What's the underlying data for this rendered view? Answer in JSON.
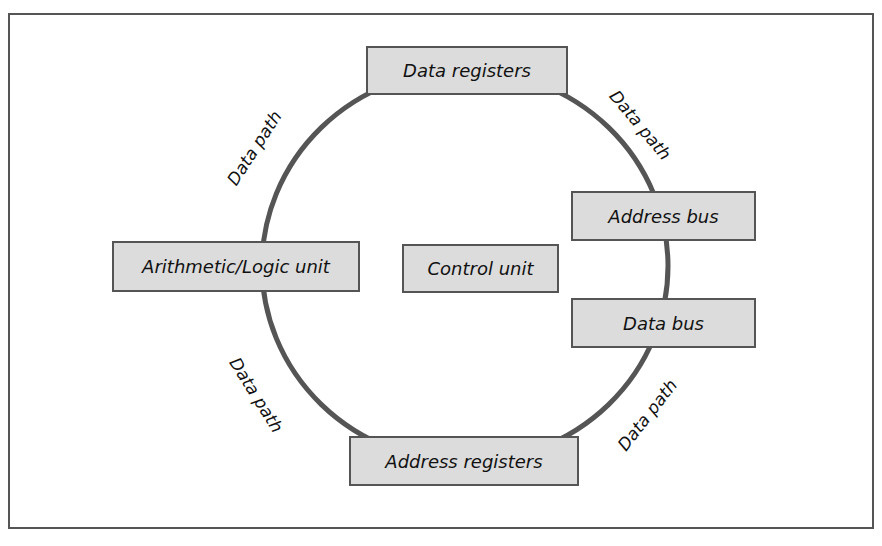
{
  "diagram": {
    "title": "",
    "nodes": [
      {
        "id": "data-registers",
        "label": "Data registers"
      },
      {
        "id": "alu",
        "label": "Arithmetic/Logic unit"
      },
      {
        "id": "control-unit",
        "label": "Control unit"
      },
      {
        "id": "address-bus",
        "label": "Address bus"
      },
      {
        "id": "data-bus",
        "label": "Data bus"
      },
      {
        "id": "address-registers",
        "label": "Address registers"
      }
    ],
    "edge_labels": [
      {
        "id": "top-left",
        "label": "Data path"
      },
      {
        "id": "top-right",
        "label": "Data path"
      },
      {
        "id": "bottom-left",
        "label": "Data path"
      },
      {
        "id": "bottom-right",
        "label": "Data path"
      }
    ],
    "colors": {
      "ring": "#555555",
      "box_fill": "#dcdcdc",
      "border": "#555555"
    }
  }
}
